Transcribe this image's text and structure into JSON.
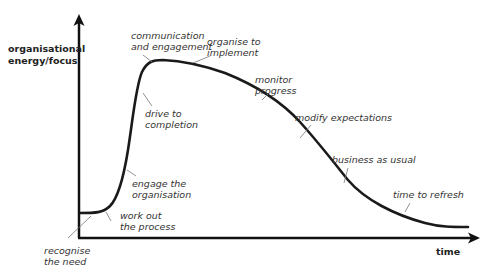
{
  "diagram": {
    "type": "line-curve",
    "y_axis_label": "organisational\nenergy/focus",
    "x_axis_label": "time",
    "stages": [
      {
        "label": "recognise\nthe need"
      },
      {
        "label": "work out\nthe process"
      },
      {
        "label": "engage the\norganisation"
      },
      {
        "label": "drive to\ncompletion"
      },
      {
        "label": "communication\nand engagement"
      },
      {
        "label": "organise to\nimplement"
      },
      {
        "label": "monitor\nprogress"
      },
      {
        "label": "modify expectations"
      },
      {
        "label": "business as usual"
      },
      {
        "label": "time to refresh"
      }
    ]
  }
}
